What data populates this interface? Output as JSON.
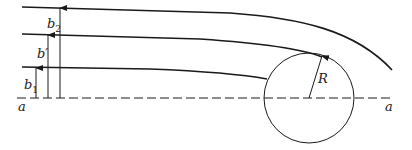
{
  "diagram": {
    "type": "streamlines around a cylinder",
    "labels": {
      "b2": {
        "base": "b",
        "sub": "2"
      },
      "b_prime": "b′",
      "b1": {
        "base": "b",
        "sub": "1"
      },
      "axis_left": "a",
      "axis_right": "a",
      "radius": "R"
    },
    "colors": {
      "line": "#1a1a1a",
      "background": "#ffffff"
    }
  }
}
